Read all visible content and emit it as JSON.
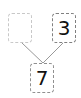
{
  "number_bond": {
    "part_left": "",
    "part_right": "3",
    "whole": "7"
  }
}
